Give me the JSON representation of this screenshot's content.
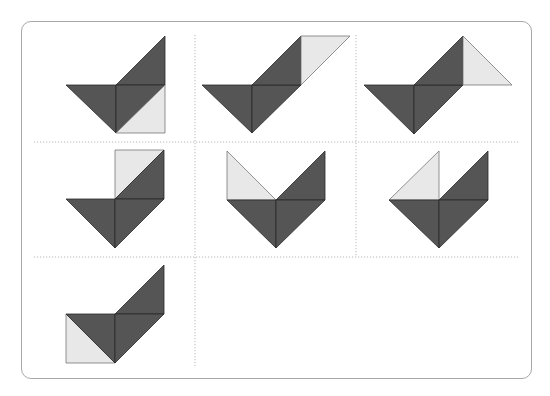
{
  "colors": {
    "dark": "#555555",
    "light": "#e8e8e8",
    "grid": "#b8b8b8",
    "border": "#a8a8a8"
  },
  "grid": {
    "rows": 3,
    "columns": 3,
    "filled_cells": 7
  },
  "figures": [
    {
      "id": "figure-1",
      "pieces": [
        {
          "shade": "dark",
          "pts": [
            [
              66,
              85
            ],
            [
              116,
              85
            ],
            [
              116,
              133
            ]
          ]
        },
        {
          "shade": "dark",
          "pts": [
            [
              116,
              85
            ],
            [
              165,
              36
            ],
            [
              165,
              85
            ]
          ]
        },
        {
          "shade": "dark",
          "pts": [
            [
              116,
              85
            ],
            [
              165,
              85
            ],
            [
              116,
              133
            ]
          ]
        },
        {
          "shade": "light",
          "pts": [
            [
              165,
              85
            ],
            [
              165,
              133
            ],
            [
              116,
              133
            ]
          ]
        }
      ]
    },
    {
      "id": "figure-2",
      "pieces": [
        {
          "shade": "dark",
          "pts": [
            [
              202,
              85
            ],
            [
              252,
              85
            ],
            [
              252,
              133
            ]
          ]
        },
        {
          "shade": "dark",
          "pts": [
            [
              252,
              85
            ],
            [
              301,
              85
            ],
            [
              252,
              133
            ]
          ]
        },
        {
          "shade": "dark",
          "pts": [
            [
              252,
              85
            ],
            [
              301,
              36
            ],
            [
              301,
              85
            ]
          ]
        },
        {
          "shade": "light",
          "pts": [
            [
              301,
              36
            ],
            [
              350,
              36
            ],
            [
              301,
              85
            ]
          ]
        }
      ]
    },
    {
      "id": "figure-3",
      "pieces": [
        {
          "shade": "dark",
          "pts": [
            [
              364,
              85
            ],
            [
              414,
              85
            ],
            [
              414,
              134
            ]
          ]
        },
        {
          "shade": "dark",
          "pts": [
            [
              414,
              85
            ],
            [
              463,
              85
            ],
            [
              414,
              134
            ]
          ]
        },
        {
          "shade": "dark",
          "pts": [
            [
              414,
              85
            ],
            [
              463,
              36
            ],
            [
              463,
              85
            ]
          ]
        },
        {
          "shade": "light",
          "pts": [
            [
              463,
              36
            ],
            [
              512,
              85
            ],
            [
              463,
              85
            ]
          ]
        }
      ]
    },
    {
      "id": "figure-4",
      "pieces": [
        {
          "shade": "light",
          "pts": [
            [
              115,
              150
            ],
            [
              164,
              150
            ],
            [
              115,
              199
            ]
          ]
        },
        {
          "shade": "dark",
          "pts": [
            [
              164,
              150
            ],
            [
              164,
              199
            ],
            [
              115,
              199
            ]
          ]
        },
        {
          "shade": "dark",
          "pts": [
            [
              66,
              199
            ],
            [
              115,
              199
            ],
            [
              115,
              248
            ]
          ]
        },
        {
          "shade": "dark",
          "pts": [
            [
              115,
              199
            ],
            [
              164,
              199
            ],
            [
              115,
              248
            ]
          ]
        }
      ]
    },
    {
      "id": "figure-5",
      "pieces": [
        {
          "shade": "light",
          "pts": [
            [
              227,
              151
            ],
            [
              227,
              200
            ],
            [
              276,
              200
            ]
          ]
        },
        {
          "shade": "dark",
          "pts": [
            [
              276,
              200
            ],
            [
              325,
              151
            ],
            [
              325,
              200
            ]
          ]
        },
        {
          "shade": "dark",
          "pts": [
            [
              227,
              200
            ],
            [
              276,
              200
            ],
            [
              276,
              248
            ]
          ]
        },
        {
          "shade": "dark",
          "pts": [
            [
              276,
              200
            ],
            [
              325,
              200
            ],
            [
              276,
              248
            ]
          ]
        }
      ]
    },
    {
      "id": "figure-6",
      "pieces": [
        {
          "shade": "light",
          "pts": [
            [
              389,
              200
            ],
            [
              439,
              151
            ],
            [
              439,
              200
            ]
          ]
        },
        {
          "shade": "dark",
          "pts": [
            [
              439,
              200
            ],
            [
              488,
              151
            ],
            [
              488,
              200
            ]
          ]
        },
        {
          "shade": "dark",
          "pts": [
            [
              389,
              200
            ],
            [
              439,
              200
            ],
            [
              439,
              248
            ]
          ]
        },
        {
          "shade": "dark",
          "pts": [
            [
              439,
              200
            ],
            [
              488,
              200
            ],
            [
              439,
              248
            ]
          ]
        }
      ]
    },
    {
      "id": "figure-7",
      "pieces": [
        {
          "shade": "light",
          "pts": [
            [
              66,
              314
            ],
            [
              66,
              363
            ],
            [
              115,
              363
            ]
          ]
        },
        {
          "shade": "dark",
          "pts": [
            [
              66,
              314
            ],
            [
              115,
              314
            ],
            [
              115,
              363
            ]
          ]
        },
        {
          "shade": "dark",
          "pts": [
            [
              115,
              314
            ],
            [
              164,
              265
            ],
            [
              164,
              314
            ]
          ]
        },
        {
          "shade": "dark",
          "pts": [
            [
              115,
              314
            ],
            [
              164,
              314
            ],
            [
              115,
              363
            ]
          ]
        }
      ]
    }
  ]
}
